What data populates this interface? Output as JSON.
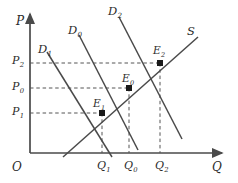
{
  "figure": {
    "type": "supply-demand-diagram",
    "background": "#ffffff",
    "line_color": "#4a4a4a",
    "dash_color": "#555555",
    "text_color": "#2b2b2b",
    "width": 238,
    "height": 183
  },
  "axes": {
    "y_label": "P",
    "x_label": "Q",
    "origin_label": "O",
    "y_axis": {
      "x": 30,
      "top": 14,
      "bottom": 153
    },
    "x_axis": {
      "y": 153,
      "left": 30,
      "right": 222
    }
  },
  "price_ticks": [
    {
      "label": "P",
      "sub": "2",
      "value_y": 62,
      "x": 12
    },
    {
      "label": "P",
      "sub": "0",
      "value_y": 88,
      "x": 12
    },
    {
      "label": "P",
      "sub": "1",
      "value_y": 113,
      "x": 12
    }
  ],
  "quantity_ticks": [
    {
      "label": "Q",
      "sub": "1",
      "value_x": 102,
      "y": 160
    },
    {
      "label": "Q",
      "sub": "0",
      "value_x": 129,
      "y": 160
    },
    {
      "label": "Q",
      "sub": "2",
      "value_x": 160,
      "y": 160
    }
  ],
  "curves": [
    {
      "name": "demand-1",
      "label": "D",
      "sub": "1",
      "label_x": 38,
      "label_y": 44,
      "x1": 47,
      "y1": 52,
      "x2": 112,
      "y2": 157
    },
    {
      "name": "demand-0",
      "label": "D",
      "sub": "0",
      "label_x": 68,
      "label_y": 25,
      "x1": 79,
      "y1": 35,
      "x2": 138,
      "y2": 150
    },
    {
      "name": "demand-2",
      "label": "D",
      "sub": "2",
      "label_x": 108,
      "label_y": 6,
      "x1": 119,
      "y1": 17,
      "x2": 182,
      "y2": 139
    },
    {
      "name": "supply",
      "label": "S",
      "sub": "",
      "label_x": 187,
      "label_y": 26,
      "x1": 63,
      "y1": 157,
      "x2": 198,
      "y2": 37
    }
  ],
  "equilibria": [
    {
      "name": "E",
      "sub": "1",
      "x": 102,
      "y": 113,
      "label_x": 93,
      "label_y": 98
    },
    {
      "name": "E",
      "sub": "0",
      "x": 129,
      "y": 88,
      "label_x": 122,
      "label_y": 73
    },
    {
      "name": "E",
      "sub": "2",
      "x": 160,
      "y": 63,
      "label_x": 153,
      "label_y": 45
    }
  ],
  "chart_data": {
    "type": "line",
    "title": "",
    "xlabel": "Q",
    "ylabel": "P",
    "legend": [
      "D1",
      "D0",
      "D2",
      "S"
    ],
    "series": [
      {
        "name": "D1",
        "x": [
          47,
          112
        ],
        "y_px": [
          52,
          157
        ],
        "note": "demand curve, leftmost, downward sloping"
      },
      {
        "name": "D0",
        "x": [
          79,
          138
        ],
        "y_px": [
          35,
          150
        ],
        "note": "demand curve, middle, downward sloping"
      },
      {
        "name": "D2",
        "x": [
          119,
          182
        ],
        "y_px": [
          17,
          139
        ],
        "note": "demand curve, rightmost, downward sloping"
      },
      {
        "name": "S",
        "x": [
          63,
          198
        ],
        "y_px": [
          157,
          37
        ],
        "note": "supply curve, upward sloping"
      }
    ],
    "equilibrium_points": [
      {
        "label": "E1",
        "price": "P1",
        "quantity": "Q1"
      },
      {
        "label": "E0",
        "price": "P0",
        "quantity": "Q0"
      },
      {
        "label": "E2",
        "price": "P2",
        "quantity": "Q2"
      }
    ],
    "xticks": [
      "Q1",
      "Q0",
      "Q2"
    ],
    "yticks": [
      "P1",
      "P0",
      "P2"
    ],
    "grid": false,
    "annotation": "Rightward shifts of demand from D1 to D0 to D2 along a fixed supply curve S raise both equilibrium price (P1 to P0 to P2) and quantity (Q1 to Q0 to Q2)."
  }
}
